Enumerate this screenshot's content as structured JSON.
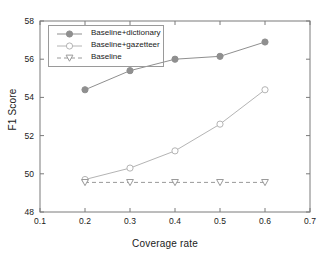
{
  "chart_data": {
    "type": "line",
    "title": "",
    "xlabel": "Coverage rate",
    "ylabel": "F1 Score",
    "xlim": [
      0.1,
      0.7
    ],
    "ylim": [
      48,
      58
    ],
    "xticks": [
      "0.1",
      "0.2",
      "0.3",
      "0.4",
      "0.5",
      "0.6",
      "0.7"
    ],
    "xtick_values": [
      0.1,
      0.2,
      0.3,
      0.4,
      0.5,
      0.6,
      0.7
    ],
    "yticks": [
      "48",
      "50",
      "52",
      "54",
      "56",
      "58"
    ],
    "ytick_values": [
      48,
      50,
      52,
      54,
      56,
      58
    ],
    "grid": false,
    "legend_position": "upper left",
    "x": [
      0.2,
      0.3,
      0.4,
      0.5,
      0.6
    ],
    "series": [
      {
        "name": "Baseline+dictionary",
        "values": [
          54.4,
          55.4,
          56.0,
          56.15,
          56.9
        ],
        "marker": "filled-circle",
        "linestyle": "solid",
        "color": "#8f8f8f"
      },
      {
        "name": "Baseline+gazetteer",
        "values": [
          49.7,
          50.3,
          51.2,
          52.6,
          54.4
        ],
        "marker": "open-circle",
        "linestyle": "solid",
        "color": "#b4b4b4"
      },
      {
        "name": "Baseline",
        "values": [
          49.55,
          49.55,
          49.55,
          49.55,
          49.55
        ],
        "marker": "open-triangle-down",
        "linestyle": "dashed",
        "color": "#9a9a9a"
      }
    ]
  },
  "legend": {
    "items": [
      {
        "label": "Baseline+dictionary"
      },
      {
        "label": "Baseline+gazetteer"
      },
      {
        "label": "Baseline"
      }
    ]
  },
  "colors": {
    "axis": "#7a7a7a",
    "text": "#1a1a1a",
    "dictionary": "#8f8f8f",
    "gazetteer": "#b4b4b4",
    "baseline": "#9a9a9a",
    "background": "#ffffff"
  }
}
